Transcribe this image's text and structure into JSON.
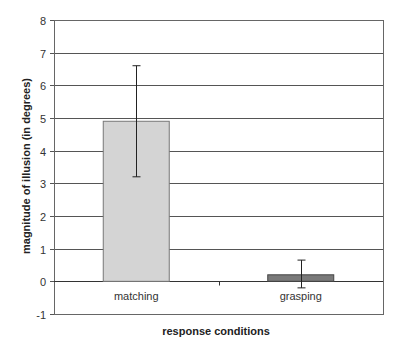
{
  "chart_data": {
    "type": "bar",
    "title": "",
    "xlabel": "response conditions",
    "ylabel": "magnitude of illusion (in degrees)",
    "categories": [
      "matching",
      "grasping"
    ],
    "values": [
      4.9,
      0.2
    ],
    "error_bars": [
      {
        "low": 3.2,
        "high": 6.6
      },
      {
        "low": -0.2,
        "high": 0.65
      }
    ],
    "bar_colors": [
      "#d4d4d4",
      "#7a7a7a"
    ],
    "ylim": [
      -1,
      8
    ],
    "yticks": [
      -1,
      0,
      1,
      2,
      3,
      4,
      5,
      6,
      7,
      8
    ],
    "grid": true,
    "legend": null
  }
}
